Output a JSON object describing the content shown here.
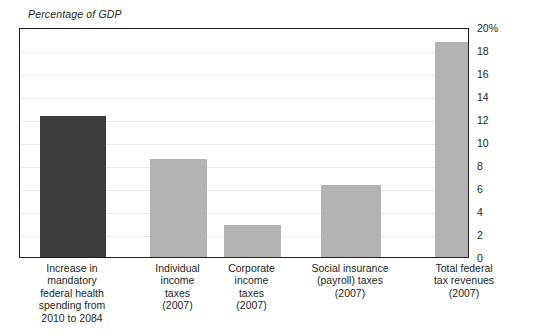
{
  "chart_data": {
    "type": "bar",
    "title": "Percentage of GDP",
    "xlabel": "",
    "ylabel": "Percentage of GDP",
    "ylim": [
      0,
      20
    ],
    "grid": true,
    "legend": "none",
    "y_ticks": [
      "20%",
      "18",
      "16",
      "14",
      "12",
      "10",
      "8",
      "6",
      "4",
      "2",
      "0"
    ],
    "y_tick_values": [
      20,
      18,
      16,
      14,
      12,
      10,
      8,
      6,
      4,
      2,
      0
    ],
    "categories": [
      "Increase in mandatory federal health spending from 2010 to 2084",
      "Individual income taxes (2007)",
      "Corporate income taxes (2007)",
      "Social insurance (payroll) taxes (2007)",
      "Total federal tax revenues (2007)"
    ],
    "category_lines": [
      [
        "Increase in",
        "mandatory",
        "federal health",
        "spending from",
        "2010 to 2084"
      ],
      [
        "Individual",
        "income",
        "taxes",
        "(2007)"
      ],
      [
        "Corporate",
        "income",
        "taxes",
        "(2007)"
      ],
      [
        "Social insurance",
        "(payroll) taxes",
        "(2007)"
      ],
      [
        "Total federal",
        "tax revenues",
        "(2007)"
      ]
    ],
    "values": [
      12.3,
      8.5,
      2.8,
      6.3,
      18.7
    ],
    "bar_colors": [
      "#3c3c3c",
      "#b3b3b3",
      "#b3b3b3",
      "#b3b3b3",
      "#b3b3b3"
    ],
    "highlight_color": "#3c3c3c",
    "series_color": "#b3b3b3"
  },
  "colors": {
    "frame": "#231f20",
    "gridline": "#e9e9e9",
    "text": "#231f20",
    "background": "#ffffff"
  }
}
